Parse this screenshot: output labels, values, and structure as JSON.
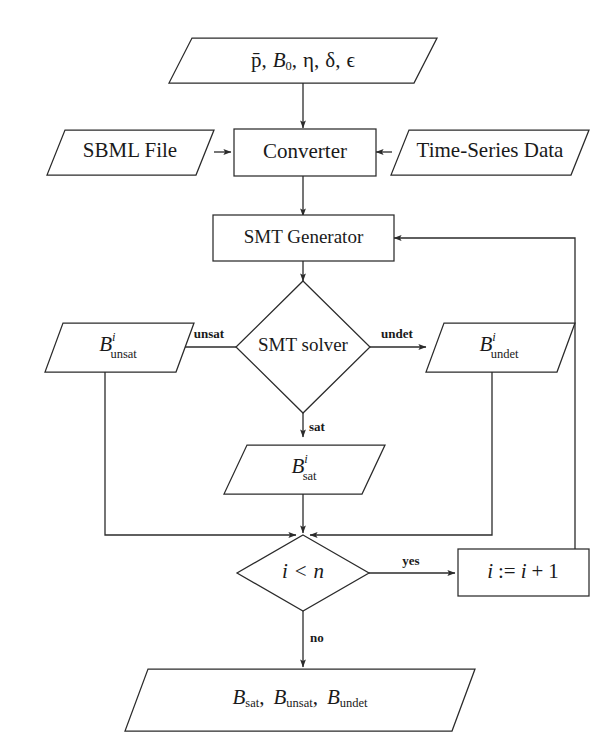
{
  "diagram": {
    "stroke_color": "#2b2b2b",
    "fill_color": "#ffffff",
    "text_color": "#1a1a1a",
    "nodes": {
      "params_input": {
        "shape": "parallelogram",
        "kind": "io",
        "text": "p̄, B₀, η, δ, ϵ",
        "parts": {
          "p_bar": "p̄",
          "b0_base": "B",
          "b0_sub": "0",
          "eta": "η",
          "delta": "δ",
          "epsilon": "ϵ",
          "comma": ","
        }
      },
      "sbml_file": {
        "shape": "parallelogram",
        "kind": "io",
        "text": "SBML File"
      },
      "time_series": {
        "shape": "parallelogram",
        "kind": "io",
        "text": "Time-Series Data"
      },
      "converter": {
        "shape": "rectangle",
        "kind": "process",
        "text": "Converter"
      },
      "smt_generator": {
        "shape": "rectangle",
        "kind": "process",
        "text": "SMT Generator"
      },
      "smt_solver": {
        "shape": "diamond",
        "kind": "decision",
        "text": "SMT solver"
      },
      "b_unsat": {
        "shape": "parallelogram",
        "kind": "io",
        "base": "B",
        "sup": "i",
        "sub": "unsat",
        "text": "B^i_unsat"
      },
      "b_undet": {
        "shape": "parallelogram",
        "kind": "io",
        "base": "B",
        "sup": "i",
        "sub": "undet",
        "text": "B^i_undet"
      },
      "b_sat": {
        "shape": "parallelogram",
        "kind": "io",
        "base": "B",
        "sup": "i",
        "sub": "sat",
        "text": "B^i_sat"
      },
      "loop_test": {
        "shape": "diamond",
        "kind": "decision",
        "base": "i",
        "op": "<",
        "bound": "n",
        "text": "i < n"
      },
      "increment": {
        "shape": "rectangle",
        "kind": "process",
        "lhs": "i",
        "assign": ":=",
        "rhs_var": "i",
        "plus": "+",
        "rhs_num": "1",
        "text": "i := i + 1"
      },
      "final_output": {
        "shape": "parallelogram",
        "kind": "io",
        "base": "B",
        "sub1": "sat",
        "sub2": "unsat",
        "sub3": "undet",
        "comma": ",",
        "text": "B_sat, B_unsat, B_undet"
      }
    },
    "edge_labels": {
      "unsat": "unsat",
      "undet": "undet",
      "sat": "sat",
      "yes": "yes",
      "no": "no"
    }
  }
}
